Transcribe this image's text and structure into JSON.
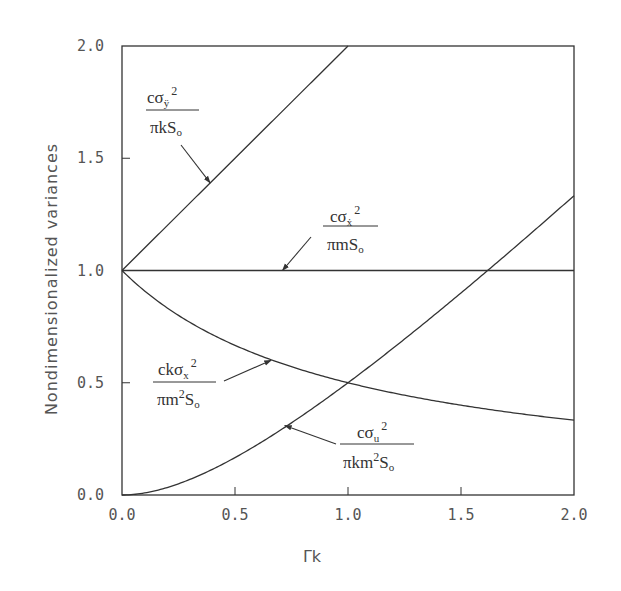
{
  "chart_data": {
    "type": "line",
    "title": "",
    "xlabel": "Γk",
    "ylabel": "Nondimensionalized variances",
    "xlim": [
      0.0,
      2.0
    ],
    "ylim": [
      0.0,
      2.0
    ],
    "grid": false,
    "x_ticks": [
      "0.0",
      "0.5",
      "1.0",
      "1.5",
      "2.0"
    ],
    "y_ticks": [
      "0.0",
      "0.5",
      "1.0",
      "1.5",
      "2.0"
    ],
    "x": [
      0.0,
      0.1,
      0.2,
      0.3,
      0.4,
      0.5,
      0.6,
      0.7,
      0.8,
      0.9,
      1.0,
      1.1,
      1.2,
      1.3,
      1.4,
      1.5,
      1.6,
      1.7,
      1.8,
      1.9,
      2.0
    ],
    "series": [
      {
        "name": "cσÿ² / πkS₀",
        "label_num": "cσ",
        "label_sub": "ÿ",
        "label_den": "πkS",
        "values": [
          1.0,
          1.1,
          1.2,
          1.3,
          1.4,
          1.5,
          1.6,
          1.7,
          1.8,
          1.9,
          2.0,
          null,
          null,
          null,
          null,
          null,
          null,
          null,
          null,
          null,
          null
        ]
      },
      {
        "name": "cσẋ² / πmS₀",
        "label_num": "cσ",
        "label_sub": "ẋ",
        "label_den": "πmS",
        "values": [
          1.0,
          1.0,
          1.0,
          1.0,
          1.0,
          1.0,
          1.0,
          1.0,
          1.0,
          1.0,
          1.0,
          1.0,
          1.0,
          1.0,
          1.0,
          1.0,
          1.0,
          1.0,
          1.0,
          1.0,
          1.0
        ]
      },
      {
        "name": "ckσx² / πm²S₀",
        "label_num": "ckσ",
        "label_sub": "x",
        "label_den": "πm",
        "values": [
          1.0,
          0.909,
          0.833,
          0.769,
          0.714,
          0.667,
          0.625,
          0.588,
          0.556,
          0.526,
          0.5,
          0.476,
          0.455,
          0.435,
          0.417,
          0.4,
          0.385,
          0.37,
          0.357,
          0.345,
          0.333
        ]
      },
      {
        "name": "cσu² / πkm²S₀",
        "label_num": "cσ",
        "label_sub": "u",
        "label_den": "πkm",
        "values": [
          0.0,
          0.009,
          0.033,
          0.069,
          0.114,
          0.167,
          0.225,
          0.288,
          0.356,
          0.426,
          0.5,
          0.576,
          0.655,
          0.735,
          0.817,
          0.9,
          0.985,
          1.07,
          1.157,
          1.244,
          1.333
        ]
      }
    ],
    "annotations": [
      {
        "series": 0,
        "text": "cσÿ²/πkS₀",
        "arrow_to": [
          0.39,
          1.39
        ]
      },
      {
        "series": 1,
        "text": "cσẋ²/πmS₀",
        "arrow_to": [
          0.71,
          1.0
        ]
      },
      {
        "series": 2,
        "text": "ckσx²/πm²S₀",
        "arrow_to": [
          0.66,
          0.6
        ]
      },
      {
        "series": 3,
        "text": "cσu²/πkm²S₀",
        "arrow_to": [
          0.72,
          0.31
        ]
      }
    ]
  },
  "labels": {
    "sup2": "2",
    "sub_o": "o",
    "S": "S"
  }
}
